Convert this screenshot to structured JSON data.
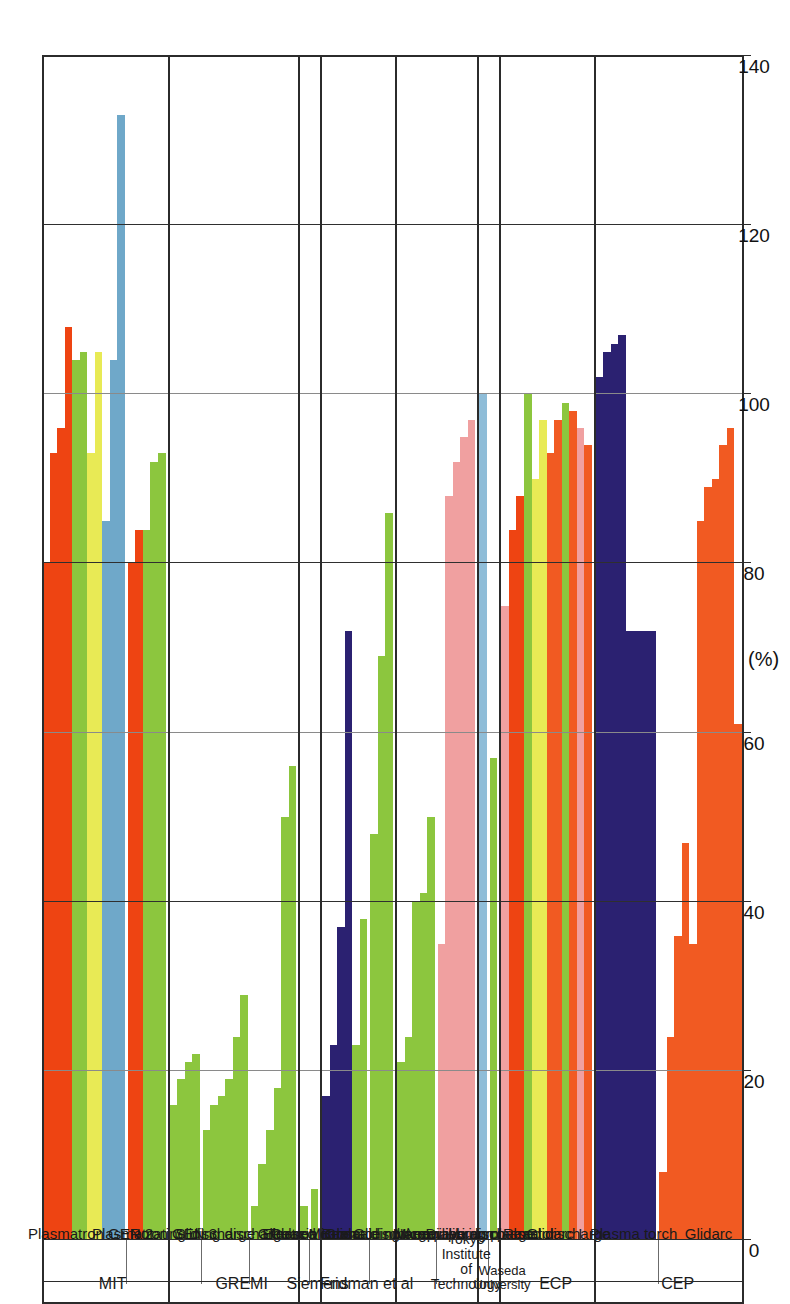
{
  "chart_data": {
    "type": "bar",
    "orientation": "horizontal-rotated",
    "title": "",
    "xlabel": "(%)",
    "ylabel": "",
    "xlim": [
      0,
      140
    ],
    "ticks": [
      0,
      20,
      40,
      60,
      80,
      100,
      120,
      140
    ],
    "grid": true,
    "legend": "none",
    "axis_unit_label": "(%)",
    "groups": [
      {
        "name": "MIT",
        "series": [
          {
            "label": "Plasmatron GEN 2",
            "bars": [
              {
                "color": "#ee4412",
                "value": 80
              },
              {
                "color": "#ee4412",
                "value": 93
              },
              {
                "color": "#ee4412",
                "value": 96
              },
              {
                "color": "#ee4412",
                "value": 108
              },
              {
                "color": "#8cc63e",
                "value": 104
              },
              {
                "color": "#8cc63e",
                "value": 105
              },
              {
                "color": "#e8ea55",
                "value": 93
              },
              {
                "color": "#e8ea55",
                "value": 105
              },
              {
                "color": "#6fa8c9",
                "value": 85
              },
              {
                "color": "#6fa8c9",
                "value": 104
              },
              {
                "color": "#6fa8c9",
                "value": 133
              }
            ]
          },
          {
            "label": "Plasmatron GEN 3",
            "bars": [
              {
                "color": "#ee4412",
                "value": 80
              },
              {
                "color": "#ee4412",
                "value": 84
              },
              {
                "color": "#8cc63e",
                "value": 84
              },
              {
                "color": "#8cc63e",
                "value": 92
              },
              {
                "color": "#8cc63e",
                "value": 93
              }
            ]
          }
        ]
      },
      {
        "name": "GREMI",
        "series": [
          {
            "label": "Rotating discharge",
            "bars": [
              {
                "color": "#8cc63e",
                "value": 16
              },
              {
                "color": "#8cc63e",
                "value": 19
              },
              {
                "color": "#8cc63e",
                "value": 21
              },
              {
                "color": "#8cc63e",
                "value": 22
              }
            ]
          },
          {
            "label": "Sliding discharge",
            "bars": [
              {
                "color": "#8cc63e",
                "value": 13
              },
              {
                "color": "#8cc63e",
                "value": 16
              },
              {
                "color": "#8cc63e",
                "value": 17
              },
              {
                "color": "#8cc63e",
                "value": 19
              },
              {
                "color": "#8cc63e",
                "value": 24
              },
              {
                "color": "#8cc63e",
                "value": 29
              }
            ]
          },
          {
            "label": "Glidarc",
            "bars": [
              {
                "color": "#8cc63e",
                "value": 4
              },
              {
                "color": "#8cc63e",
                "value": 9
              },
              {
                "color": "#8cc63e",
                "value": 13
              },
              {
                "color": "#8cc63e",
                "value": 18
              },
              {
                "color": "#8cc63e",
                "value": 50
              },
              {
                "color": "#8cc63e",
                "value": 56
              }
            ]
          }
        ]
      },
      {
        "name": "Siemens",
        "series": [
          {
            "label": "Electron Beam",
            "bars": [
              {
                "color": "#8cc63e",
                "value": 4
              }
            ]
          },
          {
            "label": "Coaxial Glidarc",
            "bars": [
              {
                "color": "#8cc63e",
                "value": 6
              }
            ]
          }
        ]
      },
      {
        "name": "Fridman et al",
        "series": [
          {
            "label": "Pulsed corona discharge",
            "bars": [
              {
                "color": "#2b2171",
                "value": 17
              },
              {
                "color": "#2b2171",
                "value": 23
              },
              {
                "color": "#2b2171",
                "value": 37
              },
              {
                "color": "#2b2171",
                "value": 72
              },
              {
                "color": "#8cc63e",
                "value": 23
              },
              {
                "color": "#8cc63e",
                "value": 38
              }
            ]
          },
          {
            "label": "Gliding Arc",
            "bars": [
              {
                "color": "#8cc63e",
                "value": 48
              },
              {
                "color": "#8cc63e",
                "value": 69
              },
              {
                "color": "#8cc63e",
                "value": 86
              }
            ]
          }
        ]
      },
      {
        "name": "Tokyo Institute of Technology",
        "series": [
          {
            "label": "Microscale non equilibrium plasma",
            "bars": [
              {
                "color": "#8cc63e",
                "value": 21
              },
              {
                "color": "#8cc63e",
                "value": 24
              },
              {
                "color": "#8cc63e",
                "value": 40
              },
              {
                "color": "#8cc63e",
                "value": 41
              },
              {
                "color": "#8cc63e",
                "value": 50
              }
            ]
          },
          {
            "label": "Microwave discharge",
            "bars": [
              {
                "color": "#f0a0a0",
                "value": 35
              },
              {
                "color": "#f0a0a0",
                "value": 88
              },
              {
                "color": "#f0a0a0",
                "value": 92
              },
              {
                "color": "#f0a0a0",
                "value": 95
              },
              {
                "color": "#f0a0a0",
                "value": 97
              }
            ]
          }
        ]
      },
      {
        "name": "Waseda University",
        "series": [
          {
            "label": "Diaphragm Reactor",
            "bars": [
              {
                "color": "#8fbdd8",
                "value": 100
              }
            ]
          },
          {
            "label": "Nonequilibrium pulsed discharge",
            "bars": [
              {
                "color": "#8cc63e",
                "value": 57
              }
            ]
          }
        ]
      },
      {
        "name": "ECP",
        "series": [
          {
            "label": "Glidarc I",
            "bars": [
              {
                "color": "#f0a0a0",
                "value": 75
              },
              {
                "color": "#ee4412",
                "value": 84
              },
              {
                "color": "#ee4412",
                "value": 88
              },
              {
                "color": "#8cc63e",
                "value": 100
              },
              {
                "color": "#e8ea55",
                "value": 90
              },
              {
                "color": "#e8ea55",
                "value": 97
              },
              {
                "color": "#f15a22",
                "value": 93
              },
              {
                "color": "#f15a22",
                "value": 97
              },
              {
                "color": "#8cc63e",
                "value": 99
              },
              {
                "color": "#f15a22",
                "value": 98
              },
              {
                "color": "#f0a0a0",
                "value": 96
              },
              {
                "color": "#f15a22",
                "value": 94
              }
            ]
          }
        ]
      },
      {
        "name": "CEP",
        "series": [
          {
            "label": "Plasma torch",
            "bars": [
              {
                "color": "#2b2171",
                "value": 102
              },
              {
                "color": "#2b2171",
                "value": 105
              },
              {
                "color": "#2b2171",
                "value": 106
              },
              {
                "color": "#2b2171",
                "value": 107
              },
              {
                "color": "#2b2171",
                "value": 72
              },
              {
                "color": "#2b2171",
                "value": 72
              },
              {
                "color": "#2b2171",
                "value": 72
              },
              {
                "color": "#2b2171",
                "value": 72
              }
            ]
          },
          {
            "label": "Glidarc",
            "bars": [
              {
                "color": "#f15a22",
                "value": 8
              },
              {
                "color": "#f15a22",
                "value": 24
              },
              {
                "color": "#f15a22",
                "value": 36
              },
              {
                "color": "#f15a22",
                "value": 47
              },
              {
                "color": "#f15a22",
                "value": 35
              },
              {
                "color": "#f15a22",
                "value": 85
              },
              {
                "color": "#f15a22",
                "value": 89
              },
              {
                "color": "#f15a22",
                "value": 90
              },
              {
                "color": "#f15a22",
                "value": 94
              },
              {
                "color": "#f15a22",
                "value": 96
              },
              {
                "color": "#f15a22",
                "value": 61
              }
            ]
          }
        ]
      }
    ]
  }
}
